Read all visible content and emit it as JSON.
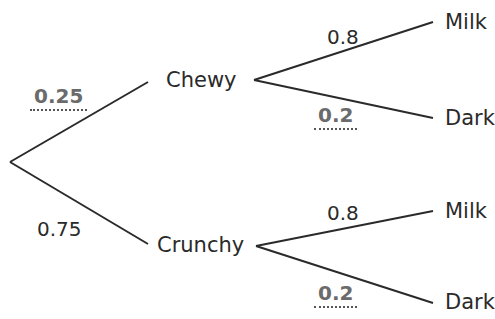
{
  "tree": {
    "level1": {
      "chewy": {
        "label": "Chewy",
        "probability": "0.25",
        "probability_is_answer": true
      },
      "crunchy": {
        "label": "Crunchy",
        "probability": "0.75",
        "probability_is_answer": false
      }
    },
    "level2": {
      "chewy_milk": {
        "label": "Milk",
        "probability": "0.8",
        "probability_is_answer": false
      },
      "chewy_dark": {
        "label": "Dark",
        "probability": "0.2",
        "probability_is_answer": true
      },
      "crunchy_milk": {
        "label": "Milk",
        "probability": "0.8",
        "probability_is_answer": false
      },
      "crunchy_dark": {
        "label": "Dark",
        "probability": "0.2",
        "probability_is_answer": true
      }
    }
  },
  "colors": {
    "line": "#2a2a2a",
    "answer_text": "#6b6b6b"
  }
}
